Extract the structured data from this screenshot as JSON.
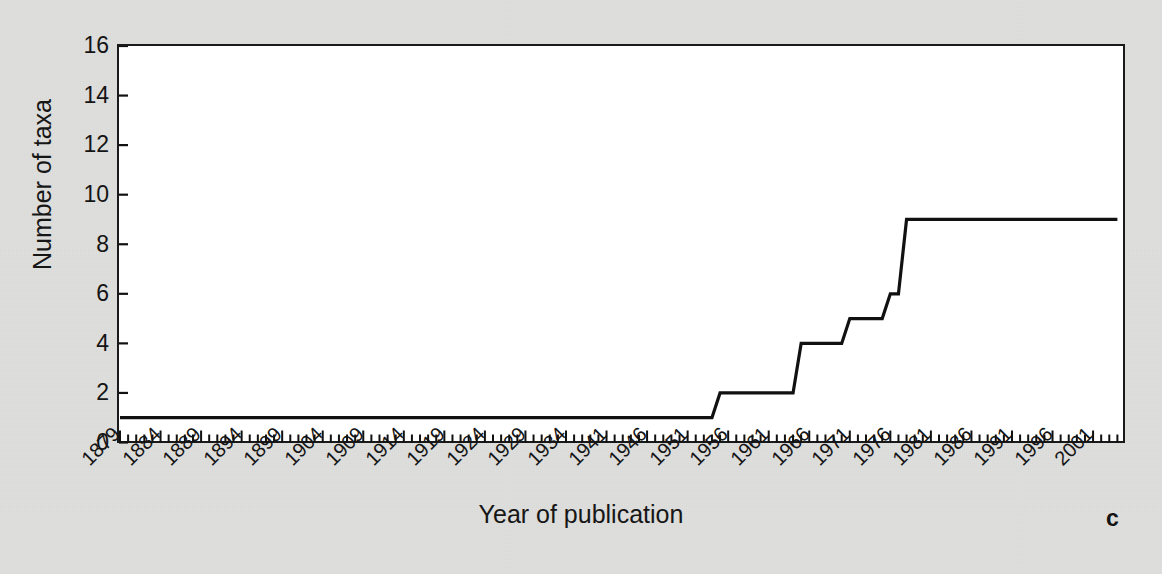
{
  "figure": {
    "panel_label": "c",
    "background_color": "#dfdfdd",
    "plot_background_color": "#ffffff",
    "line_color": "#111111"
  },
  "chart_data": {
    "type": "line",
    "title": "",
    "subtitle": "",
    "xlabel": "Year of publication",
    "ylabel": "Number of taxa",
    "ylim": [
      0,
      16
    ],
    "yticks": [
      0,
      2,
      4,
      6,
      8,
      10,
      12,
      14,
      16
    ],
    "grid": false,
    "legend": "none",
    "step_style": "linear-between-points",
    "axis_type": "categorical-year-ticks",
    "xtick_labels": [
      "1879",
      "1884",
      "1889",
      "1894",
      "1899",
      "1904",
      "1909",
      "1914",
      "1919",
      "1924",
      "1929",
      "1934",
      "1941",
      "1946",
      "1951",
      "1956",
      "1961",
      "1966",
      "1971",
      "1976",
      "1981",
      "1986",
      "1991",
      "1996",
      "2001"
    ],
    "xtick_label_interval": 5,
    "minor_ticks_per_label": 5,
    "x_axis_start": 1879,
    "x_axis_end": 2004,
    "annotations": [
      "Cumulative number of taxa described rises in discrete steps",
      "Flat at 1 taxon from 1879 until the mid-1950s",
      "Final plateau of 9 taxa reached about 1978 and held to 2004"
    ],
    "series": [
      {
        "name": "Cumulative number of taxa",
        "x": [
          1879,
          1954,
          1955,
          1964,
          1965,
          1970,
          1971,
          1975,
          1976,
          1977,
          1978,
          2004
        ],
        "values": [
          1,
          1,
          2,
          2,
          4,
          4,
          5,
          5,
          6,
          6,
          9,
          9
        ]
      }
    ]
  }
}
